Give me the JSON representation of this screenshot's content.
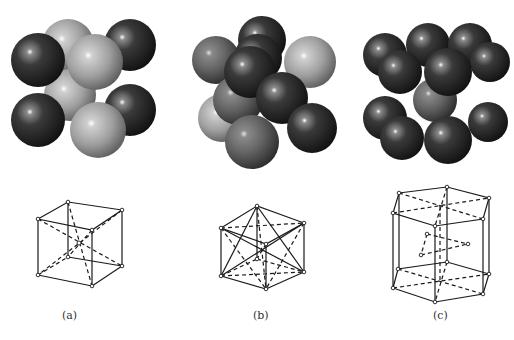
{
  "figure": {
    "panels": [
      {
        "id": "a",
        "label": "(a)",
        "structure": "body-centered cubic",
        "sphere_count_visible": 9,
        "sphere_colors": [
          "dark",
          "light"
        ]
      },
      {
        "id": "b",
        "label": "(b)",
        "structure": "face-centered cubic",
        "sphere_count_visible": 14,
        "sphere_colors": [
          "dark",
          "medium",
          "light"
        ]
      },
      {
        "id": "c",
        "label": "(c)",
        "structure": "hexagonal close-packed",
        "sphere_count_visible": 17,
        "sphere_colors": [
          "dark"
        ]
      }
    ],
    "colors": {
      "dark_sphere": "#2a2a2a",
      "medium_sphere": "#6a6a6a",
      "light_sphere": "#a8a8a8",
      "line": "#1a1a1a",
      "background": "#ffffff"
    }
  }
}
